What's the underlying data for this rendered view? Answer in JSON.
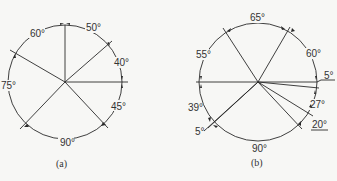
{
  "figures": [
    {
      "id": "a",
      "caption": "(a)",
      "center": [
        65,
        82
      ],
      "radius": 57,
      "radial_lines_deg": [
        90,
        40,
        0,
        -45,
        -135,
        150
      ],
      "angle_labels": [
        {
          "text": "60°",
          "x": 30,
          "y": 37
        },
        {
          "text": "50°",
          "x": 86,
          "y": 31
        },
        {
          "text": "40°",
          "x": 114,
          "y": 66
        },
        {
          "text": "45°",
          "x": 111,
          "y": 110
        },
        {
          "text": "90°",
          "x": 60,
          "y": 146
        },
        {
          "text": "75°",
          "x": 1,
          "y": 89
        }
      ]
    },
    {
      "id": "b",
      "caption": "(b)",
      "center": [
        258,
        82
      ],
      "radius": 59,
      "radial_lines_deg": [
        180,
        120,
        55,
        0,
        -5,
        -32,
        -40,
        -135,
        -140
      ],
      "angle_labels": [
        {
          "text": "65°",
          "x": 250,
          "y": 21
        },
        {
          "text": "55°",
          "x": 196,
          "y": 58
        },
        {
          "text": "60°",
          "x": 306,
          "y": 57
        },
        {
          "text": "5°",
          "x": 325,
          "y": 80
        },
        {
          "text": "27°",
          "x": 310,
          "y": 108
        },
        {
          "text": "20°",
          "x": 312,
          "y": 129
        },
        {
          "text": "39°",
          "x": 188,
          "y": 111
        },
        {
          "text": "5°",
          "x": 196,
          "y": 134
        },
        {
          "text": "90°",
          "x": 252,
          "y": 153
        }
      ]
    }
  ],
  "colors": {
    "line": "#2a2a2a",
    "text": "#333333",
    "background": "#f7f7f5"
  }
}
